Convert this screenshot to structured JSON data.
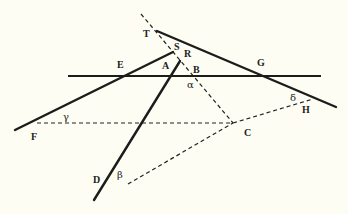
{
  "diagram": {
    "type": "geometry-figure",
    "background": "#fdfdf3",
    "line_color": "#1c1c1c",
    "points": {
      "T": {
        "label": "T",
        "x": 143,
        "y": 37
      },
      "S": {
        "label": "S",
        "x": 174,
        "y": 50
      },
      "R": {
        "label": "R",
        "x": 184,
        "y": 57
      },
      "A": {
        "label": "A",
        "x": 162,
        "y": 69
      },
      "B": {
        "label": "B",
        "x": 193,
        "y": 73
      },
      "E": {
        "label": "E",
        "x": 117,
        "y": 68
      },
      "G": {
        "label": "G",
        "x": 257,
        "y": 66
      },
      "H": {
        "label": "H",
        "x": 302,
        "y": 113
      },
      "C": {
        "label": "C",
        "x": 244,
        "y": 136
      },
      "F": {
        "label": "F",
        "x": 31,
        "y": 140
      },
      "D": {
        "label": "D",
        "x": 93,
        "y": 183
      }
    },
    "angles": {
      "alpha": {
        "label": "α",
        "x": 187,
        "y": 88
      },
      "beta": {
        "label": "β",
        "x": 117,
        "y": 178
      },
      "gamma": {
        "label": "γ",
        "x": 63,
        "y": 120
      },
      "delta": {
        "label": "δ",
        "x": 290,
        "y": 101
      }
    },
    "solid_lines": [
      {
        "name": "horizontal-line-EG",
        "x1": 68,
        "y1": 76,
        "x2": 321,
        "y2": 76
      },
      {
        "name": "line-F-S",
        "x1": 15,
        "y1": 130,
        "x2": 173,
        "y2": 52
      },
      {
        "name": "line-T-H",
        "x1": 157,
        "y1": 31,
        "x2": 336,
        "y2": 107
      },
      {
        "name": "line-R-D",
        "x1": 180,
        "y1": 61,
        "x2": 94,
        "y2": 200
      }
    ],
    "dashed_lines": [
      {
        "name": "dashed-line-through-B",
        "x1": 141,
        "y1": 14,
        "x2": 233,
        "y2": 123
      },
      {
        "name": "dashed-line-F-C",
        "x1": 37,
        "y1": 123,
        "x2": 233,
        "y2": 123
      },
      {
        "name": "dashed-line-D-C",
        "x1": 128,
        "y1": 184,
        "x2": 233,
        "y2": 123
      },
      {
        "name": "dashed-line-C-H",
        "x1": 233,
        "y1": 123,
        "x2": 313,
        "y2": 99
      }
    ]
  }
}
